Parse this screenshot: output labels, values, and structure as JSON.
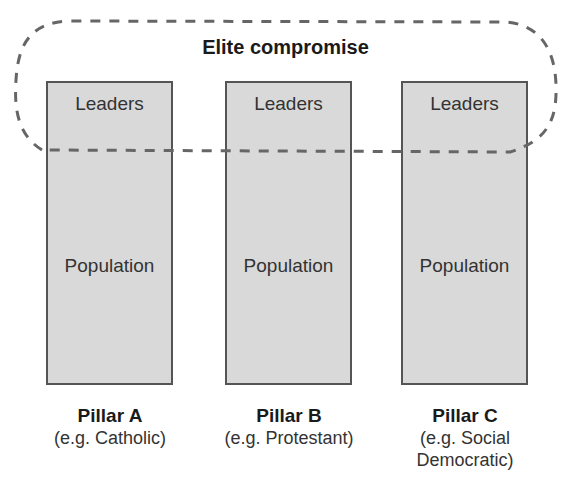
{
  "diagram": {
    "title": "Elite compromise",
    "pillars": [
      {
        "name": "Pillar A",
        "example": "(e.g. Catholic)",
        "top_label": "Leaders",
        "bottom_label": "Population"
      },
      {
        "name": "Pillar B",
        "example": "(e.g. Protestant)",
        "top_label": "Leaders",
        "bottom_label": "Population"
      },
      {
        "name": "Pillar C",
        "example": "(e.g. Social Democratic)",
        "top_label": "Leaders",
        "bottom_label": "Population"
      }
    ],
    "colors": {
      "pillar_fill": "#d9d9d9",
      "pillar_border": "#555555",
      "dash": "#666666"
    }
  }
}
